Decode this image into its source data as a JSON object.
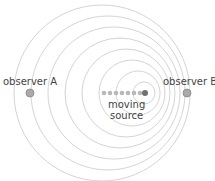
{
  "diagram": {
    "labels": {
      "observer_a": "observer A",
      "observer_b": "observer B",
      "source_line1": "moving",
      "source_line2": "source"
    },
    "colors": {
      "wavefront": "#d4d4d4",
      "observer": "#aaaaaa",
      "source_trail": "#b8b8b8",
      "source_current": "#707070",
      "text": "#444444"
    },
    "wavefronts": [
      {
        "cx": 102,
        "cy": 93,
        "r": 88
      },
      {
        "cx": 108,
        "cy": 93,
        "r": 77
      },
      {
        "cx": 114,
        "cy": 93,
        "r": 66
      },
      {
        "cx": 120,
        "cy": 93,
        "r": 55
      },
      {
        "cx": 126,
        "cy": 93,
        "r": 44
      },
      {
        "cx": 132,
        "cy": 93,
        "r": 33
      },
      {
        "cx": 138,
        "cy": 93,
        "r": 22
      },
      {
        "cx": 144,
        "cy": 93,
        "r": 11
      }
    ],
    "source_positions": [
      104,
      110,
      116,
      122,
      128,
      134,
      140,
      145
    ]
  }
}
